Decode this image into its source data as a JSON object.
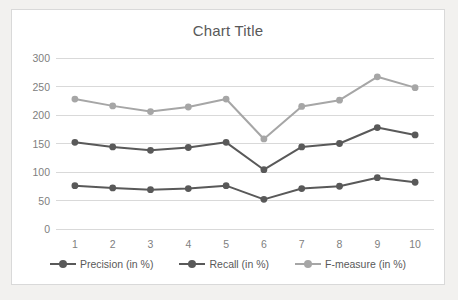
{
  "chart_data": {
    "type": "line",
    "title": "Chart Title",
    "xlabel": "",
    "ylabel": "",
    "categories": [
      "1",
      "2",
      "3",
      "4",
      "5",
      "6",
      "7",
      "8",
      "9",
      "10"
    ],
    "series": [
      {
        "name": "Precision (in %)",
        "color": "#595959",
        "values": [
          76,
          72,
          69,
          71,
          76,
          52,
          71,
          75,
          90,
          82
        ]
      },
      {
        "name": "Recall (in %)",
        "color": "#595959",
        "values": [
          152,
          144,
          138,
          143,
          152,
          104,
          144,
          150,
          178,
          165
        ]
      },
      {
        "name": "F-measure (in %)",
        "color": "#a6a6a6",
        "values": [
          228,
          216,
          206,
          214,
          228,
          158,
          215,
          226,
          267,
          248
        ]
      }
    ],
    "ylim": [
      0,
      300
    ],
    "yticks": [
      0,
      50,
      100,
      150,
      200,
      250,
      300
    ],
    "ytick_labels": [
      "0",
      "50",
      "100",
      "150",
      "200",
      "250",
      "300"
    ],
    "grid": true,
    "grid_color": "#d9d9d9",
    "legend_position": "bottom",
    "plot_background": "#ffffff",
    "page_background": "#f2f1ef",
    "border_color": "#d9d9d9"
  }
}
